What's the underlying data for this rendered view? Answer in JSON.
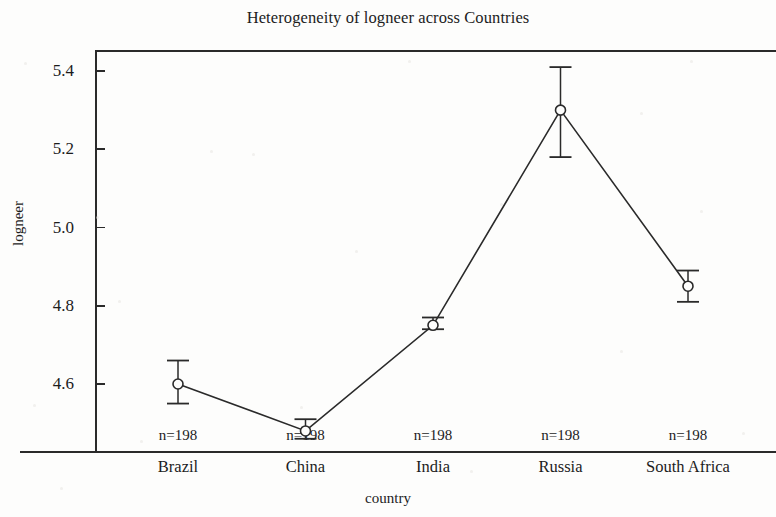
{
  "chart_data": {
    "type": "line",
    "title": "Heterogeneity of logneer across Countries",
    "xlabel": "country",
    "ylabel": "logneer",
    "categories": [
      "Brazil",
      "China",
      "India",
      "Russia",
      "South Africa"
    ],
    "values": [
      4.6,
      4.48,
      4.75,
      5.3,
      4.85
    ],
    "error_low": [
      4.55,
      4.46,
      4.74,
      5.18,
      4.81
    ],
    "error_high": [
      4.66,
      4.51,
      4.77,
      5.41,
      4.89
    ],
    "point_annotations": [
      "n=198",
      "n=198",
      "n=198",
      "n=198",
      "n=198"
    ],
    "y_ticks": [
      "5.4",
      "5.2",
      "5.0",
      "4.8",
      "4.6"
    ],
    "y_tick_values": [
      5.4,
      5.2,
      5.0,
      4.8,
      4.6
    ],
    "ylim": [
      4.44,
      5.49
    ],
    "grid": false,
    "legend": "none",
    "marker": "open-circle",
    "line_color": "#2a2a2a",
    "marker_color": "#2a2a2a",
    "error_bar_color": "#2a2a2a"
  },
  "axis": {
    "y_title": "logneer",
    "x_title": "country"
  }
}
